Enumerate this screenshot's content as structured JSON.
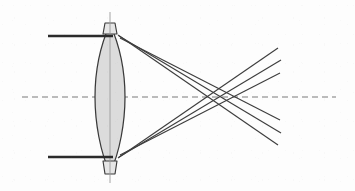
{
  "figure": {
    "type": "optics-ray-diagram",
    "width": 355,
    "height": 191,
    "background_color": "#fdfdfd"
  },
  "colors": {
    "ray_stroke": "#3d3d3d",
    "incoming_ray_stroke": "#2b2b2b",
    "axis_stroke": "#7a7a7a",
    "lens_fill": "#dcdcdc",
    "lens_stroke": "#3a3a3a",
    "centerline_stroke": "#9a9a9a"
  },
  "optical_axis": {
    "label": "optical axis",
    "style": "dashed",
    "y": 97,
    "x_start": 22,
    "x_end": 336,
    "dash_pattern": "6 4"
  },
  "lens": {
    "label": "biconvex lens",
    "center_x": 110,
    "center_y": 97,
    "top_y": 22,
    "bottom_y": 175,
    "half_thickness": 15,
    "edge_half_width": 5,
    "fill": "#dcdcdc",
    "outline": "#3a3a3a",
    "centerline": {
      "x": 110,
      "y_start": 12,
      "y_end": 183
    }
  },
  "incoming_rays": [
    {
      "name": "upper-parallel-ray",
      "x_start": 48,
      "y": 36,
      "x_end": 113
    },
    {
      "name": "lower-parallel-ray",
      "x_start": 48,
      "y": 157,
      "x_end": 113
    }
  ],
  "refracted_rays": [
    {
      "name": "upper-ray-marginal",
      "x1": 118,
      "y1": 35,
      "x2": 278,
      "y2": 145,
      "axis_crossing_x": 193
    },
    {
      "name": "upper-ray-middle",
      "x1": 119,
      "y1": 36,
      "x2": 281,
      "y2": 133,
      "axis_crossing_x": 206
    },
    {
      "name": "upper-ray-paraxial",
      "x1": 120,
      "y1": 38,
      "x2": 280,
      "y2": 120,
      "axis_crossing_x": 221
    },
    {
      "name": "lower-ray-marginal",
      "x1": 118,
      "y1": 158,
      "x2": 278,
      "y2": 48,
      "axis_crossing_x": 193
    },
    {
      "name": "lower-ray-middle",
      "x1": 119,
      "y1": 157,
      "x2": 281,
      "y2": 60,
      "axis_crossing_x": 206
    },
    {
      "name": "lower-ray-paraxial",
      "x1": 120,
      "y1": 155,
      "x2": 280,
      "y2": 73,
      "axis_crossing_x": 221
    }
  ],
  "focus_region": {
    "label": "circle of least confusion / caustic region",
    "x_start": 193,
    "x_end": 222,
    "y": 97
  }
}
